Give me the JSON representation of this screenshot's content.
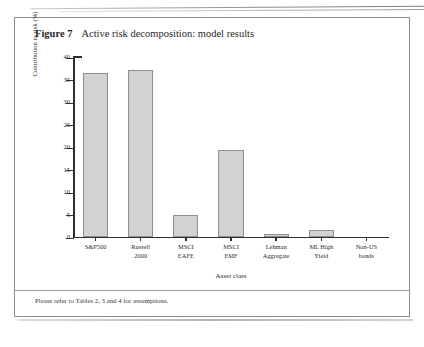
{
  "figure": {
    "number_label": "Figure 7",
    "caption": "Active risk decomposition: model results",
    "footer_note": "Please refer to Tables 2, 3 and 4 for assumptions.",
    "page_header_fragment": ""
  },
  "chart_data": {
    "type": "bar",
    "title": "Active risk decomposition: model results",
    "xlabel": "Asset class",
    "ylabel": "Contribution to risk (%)",
    "categories": [
      "S&P500",
      "Russell 2000",
      "MSCI EAFE",
      "MSCI EMF",
      "Lehman Aggregate",
      "ML High Yield",
      "Non-US bonds"
    ],
    "category_lines": [
      [
        "S&P500",
        ""
      ],
      [
        "Russell",
        "2000"
      ],
      [
        "MSCI",
        "EAFE"
      ],
      [
        "MSCI",
        "EMF"
      ],
      [
        "Lehman",
        "Aggregate"
      ],
      [
        "ML High",
        "Yield"
      ],
      [
        "Non-US",
        "bonds"
      ]
    ],
    "values": [
      36.4,
      37.0,
      4.7,
      19.3,
      0.6,
      1.4,
      0.0
    ],
    "ylim": [
      0,
      40
    ],
    "yticks": [
      0,
      5,
      10,
      15,
      20,
      25,
      30,
      35,
      40
    ],
    "ytick_labels": [
      "0",
      "5",
      "10",
      "15",
      "20",
      "25",
      "30",
      "35",
      "40"
    ],
    "grid": false,
    "legend": "none",
    "bar_color": "#d2d2d2",
    "bar_edge_color": "#8f8f8f",
    "axis_color": "#2f2f2f"
  }
}
